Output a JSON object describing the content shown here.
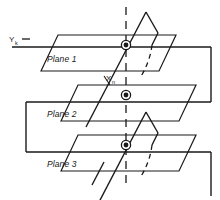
{
  "figure": {
    "title": "",
    "stroke_color": "#1a1a1a",
    "node_fill_color": "#1a1a1a",
    "background_color": "#ffffff",
    "labels": {
      "plane1": "Plane 1",
      "plane2": "Plane 2",
      "plane3": "Plane 3",
      "y_axis": "Y",
      "y_axis_subscript": "k",
      "x_node": "X",
      "x_node_subscript": "n"
    },
    "planes": [
      {
        "name": "Plane 1",
        "label": "Plane 1"
      },
      {
        "name": "Plane 2",
        "label": "Plane 2"
      },
      {
        "name": "Plane 3",
        "label": "Plane 3"
      }
    ],
    "nodes": [
      {
        "name": "node-plane-1",
        "x": 126,
        "y": 45
      },
      {
        "name": "node-plane-2",
        "x": 126,
        "y": 95
      },
      {
        "name": "node-plane-3",
        "x": 126,
        "y": 145
      }
    ]
  }
}
